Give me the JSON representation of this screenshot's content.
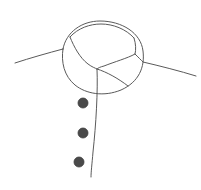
{
  "artwork": {
    "title": "Shirt collar with three buttons",
    "subject": "shirt-collar",
    "style": "line-drawing",
    "background_color": "#ffffff",
    "stroke_color": "#5a5a5a",
    "stroke_width": 1,
    "button_color": "#4a4a4a",
    "button_outline_color": "#3d3d3d",
    "canvas": {
      "width": 201,
      "height": 190
    }
  },
  "shapes": {
    "left_shoulder": {
      "name": "left-shoulder-line",
      "d": "M 15 63 C 30 58 48 53 63 49"
    },
    "right_shoulder": {
      "name": "right-shoulder-line",
      "d": "M 143 62 C 160 66 180 71 196 76"
    },
    "collar_outer": {
      "name": "collar-outer-contour",
      "d": "M 63 49 C 66 32 82 21 100 21 C 122 21 141 33 143 51 C 145 67 139 82 121 90 C 104 97 86 94 75 85 C 64 76 61 62 63 49 Z"
    },
    "collar_inner_left": {
      "name": "collar-inner-left-fold",
      "d": "M 70 37 C 74 47 80 58 88 64 C 92 67 95 68 97 69"
    },
    "collar_inner_top": {
      "name": "collar-inner-top-band",
      "d": "M 70 37 C 78 28 90 24 101 24 C 113 24 126 29 134 38"
    },
    "collar_inner_right": {
      "name": "collar-inner-right-fold",
      "d": "M 134 38 C 136 44 136 50 135 54 C 128 58 114 62 104 66 C 100 67 98 68 97 69"
    },
    "collar_right_edge": {
      "name": "collar-right-edge-line",
      "d": "M 135 54 C 138 57 141 60 143 62"
    },
    "collar_sweep": {
      "name": "collar-lower-sweep",
      "d": "M 97 69 C 107 72 119 79 128 86"
    },
    "placket": {
      "name": "placket-center-line",
      "d": "M 97 69 C 98 90 96 125 93 152 C 92 164 91 172 91 177"
    }
  },
  "buttons": [
    {
      "name": "button-top",
      "cx": 83,
      "cy": 103,
      "r": 5
    },
    {
      "name": "button-middle",
      "cx": 83,
      "cy": 133,
      "r": 5
    },
    {
      "name": "button-bottom",
      "cx": 79,
      "cy": 162,
      "r": 5
    }
  ]
}
